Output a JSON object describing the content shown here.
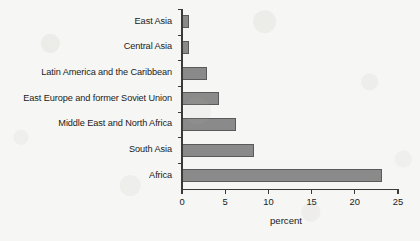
{
  "chart_data": {
    "type": "bar",
    "orientation": "horizontal",
    "title": "",
    "subtitle": "",
    "xlabel": "percent",
    "ylabel": "",
    "categories": [
      "East Asia",
      "Central Asia",
      "Latin America and the Caribbean",
      "East Europe and former Soviet Union",
      "Middle East and North Africa",
      "South Asia",
      "Africa"
    ],
    "values": [
      0.8,
      0.8,
      2.9,
      4.3,
      6.2,
      8.3,
      23.2
    ],
    "xlim": [
      0,
      25
    ],
    "xticks": [
      0,
      5,
      10,
      15,
      20,
      25
    ],
    "xtick_labels": [
      "0",
      "5",
      "10",
      "15",
      "20",
      "25"
    ],
    "grid": false,
    "legend": false,
    "bar_color": "#8a8a8a",
    "bar_edge_color": "#5a5a5a",
    "axis_color": "#3a3a3a",
    "background_color": "#f6f6f4"
  }
}
